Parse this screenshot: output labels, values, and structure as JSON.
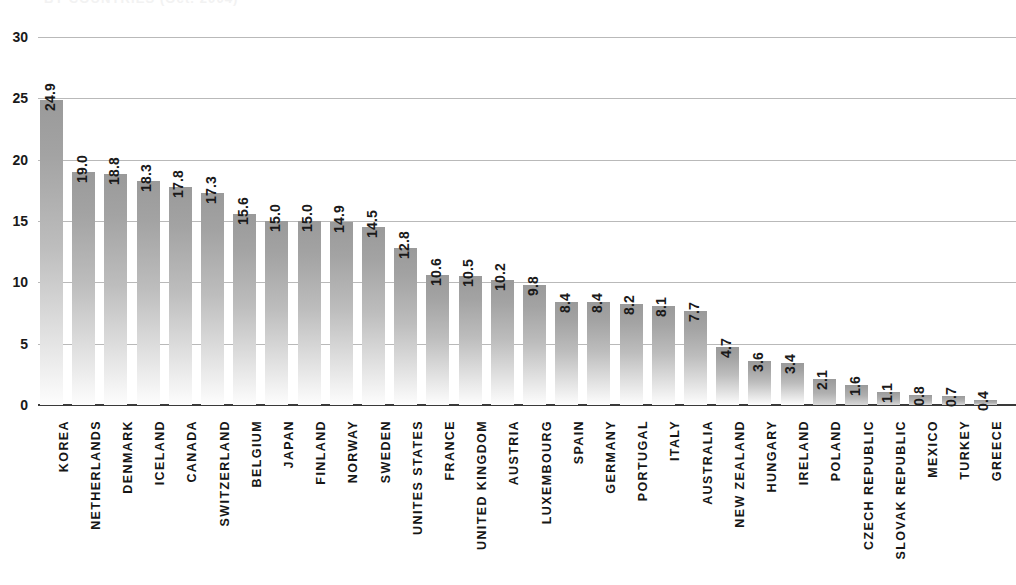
{
  "chart_data": {
    "type": "bar",
    "title": "BY COUNTRIES (Oct. 2004)",
    "xlabel": "",
    "ylabel": "",
    "ylim": [
      0,
      30
    ],
    "ytick_step": 5,
    "yticks": [
      "0",
      "5",
      "10",
      "15",
      "20",
      "25",
      "30"
    ],
    "grid": true,
    "legend": "none",
    "bar_color": "#a8a8a8",
    "value_label_format": "one-decimal",
    "orientation": "vertical",
    "categories": [
      "KOREA",
      "NETHERLANDS",
      "DENMARK",
      "ICELAND",
      "CANADA",
      "SWITZERLAND",
      "BELGIUM",
      "JAPAN",
      "FINLAND",
      "NORWAY",
      "SWEDEN",
      "UNITES STATES",
      "FRANCE",
      "UNITED KINGDOM",
      "AUSTRIA",
      "LUXEMBOURG",
      "SPAIN",
      "GERMANY",
      "PORTUGAL",
      "ITALY",
      "AUSTRALIA",
      "NEW ZEALAND",
      "HUNGARY",
      "IRELAND",
      "POLAND",
      "CZECH REPUBLIC",
      "SLOVAK REPUBLIC",
      "MEXICO",
      "TURKEY",
      "GREECE"
    ],
    "values": [
      24.9,
      19.0,
      18.8,
      18.3,
      17.8,
      17.3,
      15.6,
      15.0,
      15.0,
      14.9,
      14.5,
      12.8,
      10.6,
      10.5,
      10.2,
      9.8,
      8.4,
      8.4,
      8.2,
      8.1,
      7.7,
      4.7,
      3.6,
      3.4,
      2.1,
      1.6,
      1.1,
      0.8,
      0.7,
      0.4
    ],
    "value_labels": [
      "24.9",
      "19.0",
      "18.8",
      "18.3",
      "17.8",
      "17.3",
      "15.6",
      "15.0",
      "15.0",
      "14.9",
      "14.5",
      "12.8",
      "10.6",
      "10.5",
      "10.2",
      "9.8",
      "8.4",
      "8.4",
      "8.2",
      "8.1",
      "7.7",
      "4.7",
      "3.6",
      "3.4",
      "2.1",
      "1.6",
      "1.1",
      "0.8",
      "0.7",
      "0.4"
    ]
  }
}
